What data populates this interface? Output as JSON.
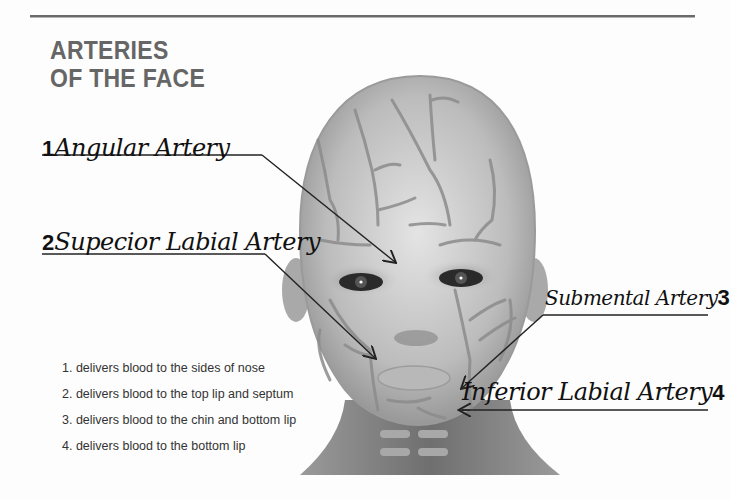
{
  "title": {
    "line1": "ARTERIES",
    "line2": "OF THE FACE"
  },
  "labels": [
    {
      "number": "1",
      "text": "Angular Artery"
    },
    {
      "number": "2",
      "text": "Supecior Labial Artery"
    },
    {
      "number": "3",
      "text": "Submental Artery"
    },
    {
      "number": "4",
      "text": "Inferior Labial Artery"
    }
  ],
  "legend": [
    "1. delivers blood to the sides of nose",
    "2. delivers blood to the top lip and septum",
    "3. delivers blood to the chin and bottom lip",
    "4. delivers blood to the bottom lip"
  ],
  "colors": {
    "title": "#666666",
    "skin_light": "#d9d9d9",
    "skin_dark": "#8a8a8a",
    "artery": "#8c8c8c",
    "leader_line": "#222222"
  }
}
